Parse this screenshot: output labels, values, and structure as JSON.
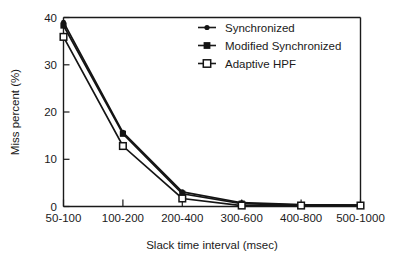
{
  "chart_data": {
    "type": "line",
    "title": "",
    "xlabel": "Slack time interval (msec)",
    "ylabel": "Miss percent (%)",
    "categories": [
      "50-100",
      "100-200",
      "200-400",
      "300-600",
      "400-800",
      "500-1000"
    ],
    "ylim": [
      0,
      40
    ],
    "yticks": [
      0,
      10,
      20,
      30,
      40
    ],
    "ytick_labels": [
      "0",
      "10",
      "20",
      "30",
      "40"
    ],
    "grid": false,
    "legend_position": "top-right",
    "series": [
      {
        "name": "Synchronized",
        "marker": "filled-circle",
        "color": "#141414",
        "values": [
          39.0,
          15.7,
          3.1,
          0.8,
          0.4,
          0.3
        ]
      },
      {
        "name": "Modified Synchronized",
        "marker": "filled-square",
        "color": "#141414",
        "values": [
          38.3,
          15.4,
          2.7,
          0.6,
          0.3,
          0.3
        ]
      },
      {
        "name": "Adaptive HPF",
        "marker": "open-square",
        "color": "#141414",
        "values": [
          35.9,
          12.8,
          1.7,
          0.2,
          0.2,
          0.2
        ]
      }
    ]
  },
  "axes": {
    "xlabel": "Slack time interval (msec)",
    "ylabel": "Miss percent (%)",
    "ytick_labels": [
      "0",
      "10",
      "20",
      "30",
      "40"
    ],
    "xtick_labels": [
      "50-100",
      "100-200",
      "200-400",
      "300-600",
      "400-800",
      "500-1000"
    ]
  },
  "legend": {
    "items": [
      {
        "label": "Synchronized",
        "marker": "filled-circle"
      },
      {
        "label": "Modified Synchronized",
        "marker": "filled-square"
      },
      {
        "label": "Adaptive HPF",
        "marker": "open-square"
      }
    ]
  }
}
